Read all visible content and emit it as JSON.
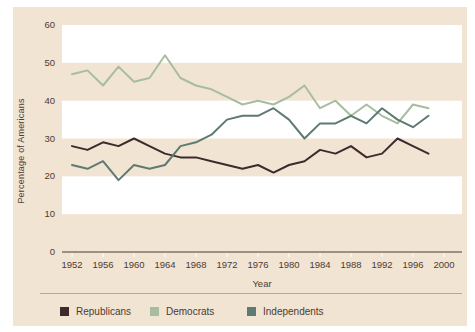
{
  "chart_data": {
    "type": "line",
    "title": "",
    "xlabel": "Year",
    "ylabel": "Percentage of Americans",
    "x_tick_labels": [
      "1952",
      "1956",
      "1960",
      "1964",
      "1968",
      "1972",
      "1976",
      "1980",
      "1984",
      "1988",
      "1992",
      "1996",
      "2000"
    ],
    "y_tick_labels": [
      "0",
      "10",
      "20",
      "30",
      "40",
      "50",
      "60"
    ],
    "ylim": [
      0,
      60
    ],
    "white_bands": [
      [
        10,
        20
      ],
      [
        30,
        40
      ],
      [
        50,
        60
      ]
    ],
    "background_color": "#f1e4d3",
    "band_color": "#ffffff",
    "axis_color": "#4f3a31",
    "legend_position": "bottom",
    "x": [
      1952,
      1954,
      1956,
      1958,
      1960,
      1962,
      1964,
      1966,
      1968,
      1970,
      1972,
      1974,
      1976,
      1978,
      1980,
      1982,
      1984,
      1986,
      1988,
      1990,
      1992,
      1994,
      1996,
      1998
    ],
    "series": [
      {
        "name": "Republicans",
        "color": "#3e2a2d",
        "values": [
          28,
          27,
          29,
          28,
          30,
          28,
          26,
          25,
          25,
          24,
          23,
          22,
          23,
          21,
          23,
          24,
          27,
          26,
          28,
          25,
          26,
          30,
          28,
          26
        ]
      },
      {
        "name": "Democrats",
        "color": "#a8bda0",
        "values": [
          47,
          48,
          44,
          49,
          45,
          46,
          52,
          46,
          44,
          43,
          41,
          39,
          40,
          39,
          41,
          44,
          38,
          40,
          36,
          39,
          36,
          34,
          39,
          38
        ]
      },
      {
        "name": "Independents",
        "color": "#5e7a72",
        "values": [
          23,
          22,
          24,
          19,
          23,
          22,
          23,
          28,
          29,
          31,
          35,
          36,
          36,
          38,
          35,
          30,
          34,
          34,
          36,
          34,
          38,
          35,
          33,
          36
        ]
      }
    ]
  }
}
